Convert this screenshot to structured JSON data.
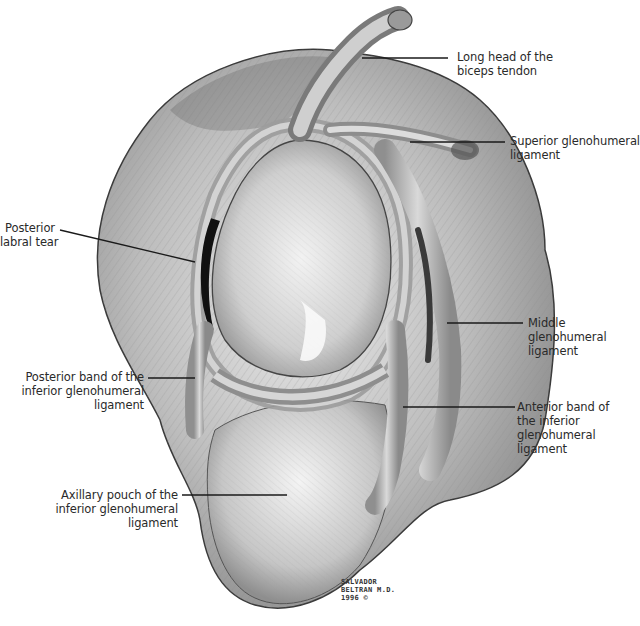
{
  "figure": {
    "background": "#ffffff",
    "ink_color": "#2a2a2a"
  },
  "labels": [
    {
      "id": "long-head-biceps",
      "lines": [
        "Long head of the",
        "biceps tendon"
      ],
      "align": "left"
    },
    {
      "id": "superior-gh-ligament",
      "lines": [
        "Superior glenohumeral",
        "ligament"
      ],
      "align": "left"
    },
    {
      "id": "posterior-labral-tear",
      "lines": [
        "Posterior",
        "labral tear"
      ],
      "align": "right"
    },
    {
      "id": "middle-gh-ligament",
      "lines": [
        "Middle",
        "glenohumeral",
        "ligament"
      ],
      "align": "left"
    },
    {
      "id": "posterior-band-igh",
      "lines": [
        "Posterior band of the",
        "inferior glenohumeral",
        "ligament"
      ],
      "align": "right"
    },
    {
      "id": "anterior-band-igh",
      "lines": [
        "Anterior band of",
        "the inferior",
        "glenohumeral",
        "ligament"
      ],
      "align": "left"
    },
    {
      "id": "axillary-pouch-igh",
      "lines": [
        "Axillary pouch of the",
        "inferior glenohumeral",
        "ligament"
      ],
      "align": "right"
    }
  ],
  "signature": {
    "lines": [
      "SALVADOR",
      "BELTRAN M.D.",
      "1996 ©"
    ]
  }
}
